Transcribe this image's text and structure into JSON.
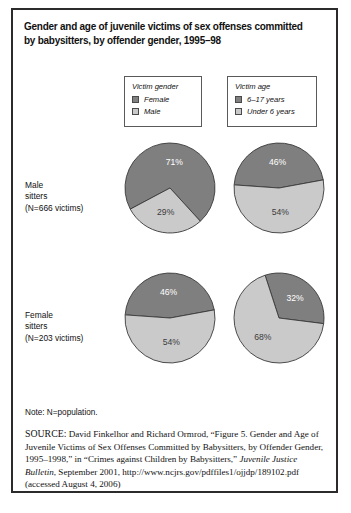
{
  "figure": {
    "title": "Gender and age of juvenile victims of sex offenses committed by babysitters, by offender gender, 1995–98",
    "note": "Note: N=population.",
    "source_keyword": "SOURCE:",
    "source_text": " David Finkelhor and Richard Ormrod, “Figure 5. Gender and Age of Juvenile Victims of Sex Offenses Committed by Babysitters, by Offender Gender, 1995–1998,” in “Crimes against Children by Babysitters,” ",
    "source_italic": "Juvenile Justice Bulletin",
    "source_tail": ", September 2001, http://www.ncjrs.gov/pdffiles1/ojjdp/189102.pdf (accessed August 4, 2006)"
  },
  "colors": {
    "dark": "#7f7f7f",
    "light": "#cacaca",
    "border": "#2b2b2b",
    "text": "#111111"
  },
  "legends": [
    {
      "id": "victim-gender",
      "title": "Victim gender",
      "items": [
        {
          "label": "Female",
          "swatch": "dark"
        },
        {
          "label": "Male",
          "swatch": "light"
        }
      ]
    },
    {
      "id": "victim-age",
      "title": "Victim age",
      "items": [
        {
          "label": "6–17 years",
          "swatch": "dark"
        },
        {
          "label": "Under 6 years",
          "swatch": "light"
        }
      ]
    }
  ],
  "rows": [
    {
      "id": "male-sitters",
      "line1": "Male",
      "line2": "sitters",
      "line3": "(N=666 victims)"
    },
    {
      "id": "female-sitters",
      "line1": "Female",
      "line2": "sitters",
      "line3": "(N=203 victims)"
    }
  ],
  "chart_data": {
    "type": "pie",
    "title": "Gender and age of juvenile victims of sex offenses committed by babysitters, by offender gender, 1995–98",
    "note": "N=population",
    "legend_position": "top",
    "charts": [
      {
        "id": "male-sitters-victim-gender",
        "row": "Male sitters (N=666 victims)",
        "legend": "Victim gender",
        "labels": [
          "Female",
          "Male"
        ],
        "values": [
          71,
          29
        ],
        "value_labels": [
          "71%",
          "29%"
        ],
        "colors": [
          "#7f7f7f",
          "#cacaca"
        ]
      },
      {
        "id": "male-sitters-victim-age",
        "row": "Male sitters (N=666 victims)",
        "legend": "Victim age",
        "labels": [
          "6–17 years",
          "Under 6 years"
        ],
        "values": [
          46,
          54
        ],
        "value_labels": [
          "46%",
          "54%"
        ],
        "colors": [
          "#7f7f7f",
          "#cacaca"
        ]
      },
      {
        "id": "female-sitters-victim-gender",
        "row": "Female sitters (N=203 victims)",
        "legend": "Victim gender",
        "labels": [
          "Female",
          "Male"
        ],
        "values": [
          46,
          54
        ],
        "value_labels": [
          "46%",
          "54%"
        ],
        "colors": [
          "#7f7f7f",
          "#cacaca"
        ]
      },
      {
        "id": "female-sitters-victim-age",
        "row": "Female sitters (N=203 victims)",
        "legend": "Victim age",
        "labels": [
          "6–17 years",
          "Under 6 years"
        ],
        "values": [
          32,
          68
        ],
        "value_labels": [
          "32%",
          "68%"
        ],
        "colors": [
          "#7f7f7f",
          "#cacaca"
        ]
      }
    ]
  }
}
